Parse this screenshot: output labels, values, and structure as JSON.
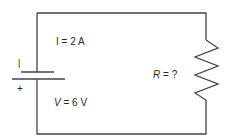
{
  "diagram": {
    "type": "circuit",
    "current_label": "I = 2 A",
    "voltage_symbol": "V",
    "voltage_rest": " = 6 V",
    "resistance_symbol": "R",
    "resistance_rest": " = ?",
    "battery_negative_mark": "|",
    "battery_positive_mark": "+",
    "line_color": "#444444"
  }
}
